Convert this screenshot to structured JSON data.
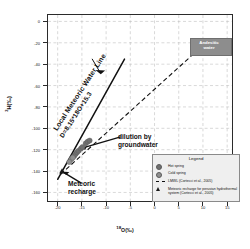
{
  "chart_data": {
    "type": "scatter",
    "title": "",
    "xlabel": "18O(‰)",
    "ylabel": "2H(‰)",
    "xlabel_sup": "18",
    "xlabel_base": "O(‰)",
    "ylabel_sup": "2",
    "ylabel_base": "H(‰)",
    "xlim": [
      -22,
      16
    ],
    "ylim": [
      -168,
      6
    ],
    "xticks": [
      -20,
      -15,
      -10,
      -5,
      0,
      5,
      10,
      15
    ],
    "yticks": [
      0,
      -20,
      -40,
      -60,
      -80,
      -100,
      -120,
      -140,
      -160
    ],
    "grid": true,
    "grid_style": "dashed",
    "legend_position": "lower-right",
    "series": [
      {
        "name": "Hot spring",
        "marker": "circle",
        "color": "#6f6f6f",
        "points": [
          {
            "x": -16.6,
            "y": -126.0
          },
          {
            "x": -16.3,
            "y": -124.0
          },
          {
            "x": -16.0,
            "y": -122.5
          },
          {
            "x": -15.7,
            "y": -121.0
          },
          {
            "x": -15.2,
            "y": -119.0
          },
          {
            "x": -14.9,
            "y": -117.5
          },
          {
            "x": -14.2,
            "y": -114.0
          },
          {
            "x": -13.8,
            "y": -112.5
          },
          {
            "x": -13.4,
            "y": -111.5
          }
        ]
      },
      {
        "name": "Cold spring",
        "marker": "circle",
        "color": "#8f8f8f",
        "points": [
          {
            "x": -17.2,
            "y": -129.0
          },
          {
            "x": -16.9,
            "y": -127.5
          },
          {
            "x": -17.6,
            "y": -131.5
          }
        ]
      },
      {
        "name": "Meteoric recharge for peruvian hydrothermal system (Cortecci et al., 2005)",
        "marker": "triangle",
        "color": "#1a1a1a",
        "points": [
          {
            "x": -19.1,
            "y": -140.0
          }
        ]
      }
    ],
    "lines": [
      {
        "name": "Local Meteoric Water Line",
        "style": "solid",
        "color": "#111111",
        "equation": "D=8.15*18O+15.3",
        "slope": 8.15,
        "intercept": 15.3,
        "x_from": -20.0,
        "x_to": -6.2
      },
      {
        "name": "Mixing / dilution trend to andesitic water",
        "style": "dashed",
        "color": "#111111",
        "x_from": -19.4,
        "x_to": 10.6,
        "y_from": -143.0,
        "y_to": -20.0
      },
      {
        "name": "dilution by groundwater pointer",
        "style": "solid-arrow",
        "color": "#111111"
      }
    ],
    "annotations": [
      {
        "name": "lmwl-label",
        "text": "Local Meteoric Water Line",
        "rotation": -57
      },
      {
        "name": "lmwl-equation",
        "text": "D=8.15*18O+15.3",
        "rotation": -57
      },
      {
        "name": "dilution-label",
        "line1": "dilution by",
        "line2": "groundwater"
      },
      {
        "name": "recharge-label",
        "line1": "Meteoric",
        "line2": "recharge"
      },
      {
        "name": "andesitic-label",
        "line1": "Andesitic",
        "line2": "water",
        "box_color": "#8d8d8d"
      }
    ]
  },
  "legend": {
    "title": "Legend",
    "entries": [
      {
        "symbol": "circle",
        "label": "Hot spring"
      },
      {
        "symbol": "circle",
        "label": "Cold spring"
      },
      {
        "symbol": "dashline",
        "label": "LMWL (Cortecci et al., 2005)"
      },
      {
        "symbol": "triangle",
        "label": "Meteoric recharge for peruvian hydrothermal system (Cortecci et al., 2005)"
      }
    ]
  },
  "axes": {
    "xtick_labels": [
      "-20",
      "-15",
      "-10",
      "-5",
      "0",
      "5",
      "10",
      "15"
    ],
    "ytick_labels": [
      "0",
      "-20",
      "-40",
      "-60",
      "-80",
      "-100",
      "-120",
      "-140",
      "-160"
    ]
  },
  "colors": {
    "frame": "#2b2b2b",
    "grid": "#b9b9b9",
    "marker_hot": "#6f6f6f",
    "marker_cold": "#8f8f8f",
    "line": "#111111",
    "legend_bg": "#efefef",
    "callout_bg": "#8d8d8d"
  }
}
